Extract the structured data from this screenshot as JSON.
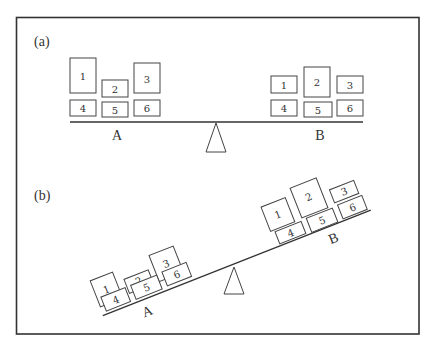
{
  "figure": {
    "panels": [
      {
        "label": "(a)",
        "state": "balanced",
        "sides": [
          {
            "label": "A",
            "boxes": [
              "1",
              "2",
              "3",
              "4",
              "5",
              "6"
            ]
          },
          {
            "label": "B",
            "boxes": [
              "1",
              "2",
              "3",
              "4",
              "5",
              "6"
            ]
          }
        ]
      },
      {
        "label": "(b)",
        "state": "tilted",
        "sides": [
          {
            "label": "A",
            "boxes": [
              "1",
              "2",
              "3",
              "4",
              "5",
              "6"
            ]
          },
          {
            "label": "B",
            "boxes": [
              "1",
              "2",
              "3",
              "4",
              "5",
              "6"
            ]
          }
        ]
      }
    ]
  },
  "colors": {
    "stroke": "#333333",
    "background": "#ffffff"
  }
}
